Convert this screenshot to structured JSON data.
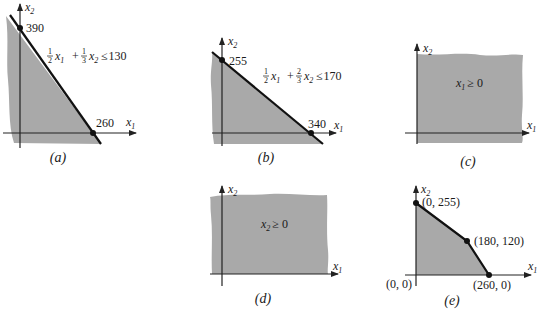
{
  "colors": {
    "shade": "#a9a9a9",
    "line": "#111111",
    "axis": "#222222",
    "text": "#1a1a1a",
    "background": "#ffffff"
  },
  "panels": {
    "a": {
      "caption": "(a)",
      "x_axis_label": "x",
      "x_axis_sub": "1",
      "y_axis_label": "x",
      "y_axis_sub": "2",
      "y_intercept_label": "390",
      "x_intercept_label": "260",
      "constraint": {
        "c1_num": "1",
        "c1_den": "2",
        "v1": "x",
        "v1_sub": "1",
        "plus": "+",
        "c2_num": "1",
        "c2_den": "3",
        "v2": "x",
        "v2_sub": "2",
        "rel": "≤",
        "rhs": "130"
      }
    },
    "b": {
      "caption": "(b)",
      "x_axis_label": "x",
      "x_axis_sub": "1",
      "y_axis_label": "x",
      "y_axis_sub": "2",
      "y_intercept_label": "255",
      "x_intercept_label": "340",
      "constraint": {
        "c1_num": "1",
        "c1_den": "2",
        "v1": "x",
        "v1_sub": "1",
        "plus": "+",
        "c2_num": "2",
        "c2_den": "3",
        "v2": "x",
        "v2_sub": "2",
        "rel": "≤",
        "rhs": "170"
      }
    },
    "c": {
      "caption": "(c)",
      "x_axis_label": "x",
      "x_axis_sub": "1",
      "y_axis_label": "x",
      "y_axis_sub": "2",
      "region": {
        "var": "x",
        "var_sub": "1",
        "rel": "≥ 0"
      }
    },
    "d": {
      "caption": "(d)",
      "x_axis_label": "x",
      "x_axis_sub": "1",
      "y_axis_label": "x",
      "y_axis_sub": "2",
      "region": {
        "var": "x",
        "var_sub": "2",
        "rel": "≥ 0"
      }
    },
    "e": {
      "caption": "(e)",
      "x_axis_label": "x",
      "x_axis_sub": "1",
      "y_axis_label": "x",
      "y_axis_sub": "2",
      "vertices": [
        {
          "label": "(0, 0)"
        },
        {
          "label": "(0, 255)"
        },
        {
          "label": "(180, 120)"
        },
        {
          "label": "(260, 0)"
        }
      ]
    }
  }
}
